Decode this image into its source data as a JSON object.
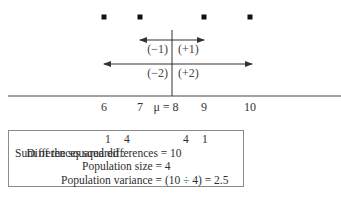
{
  "diagram": {
    "mean": 8,
    "mean_label": "μ = 8",
    "axis_ticks": [
      {
        "value": 6,
        "label": "6"
      },
      {
        "value": 7,
        "label": "7"
      },
      {
        "value": 8,
        "label": "μ = 8"
      },
      {
        "value": 9,
        "label": "9"
      },
      {
        "value": 10,
        "label": "10"
      }
    ],
    "data_points": [
      6,
      7,
      9,
      10
    ],
    "deviations": [
      {
        "from": 7,
        "to": 9,
        "left_label": "(−1)",
        "right_label": "(+1)"
      },
      {
        "from": 6,
        "to": 10,
        "left_label": "(−2)",
        "right_label": "(+2)"
      }
    ]
  },
  "summary": {
    "differences_label": "Differences squared :",
    "differences_values": [
      "1",
      "4",
      "4",
      "1"
    ],
    "sum_line": "Sum of the squared differences = 10",
    "size_line": "Population size = 4",
    "variance_line": "Population variance = (10 ÷ 4) = 2.5"
  }
}
